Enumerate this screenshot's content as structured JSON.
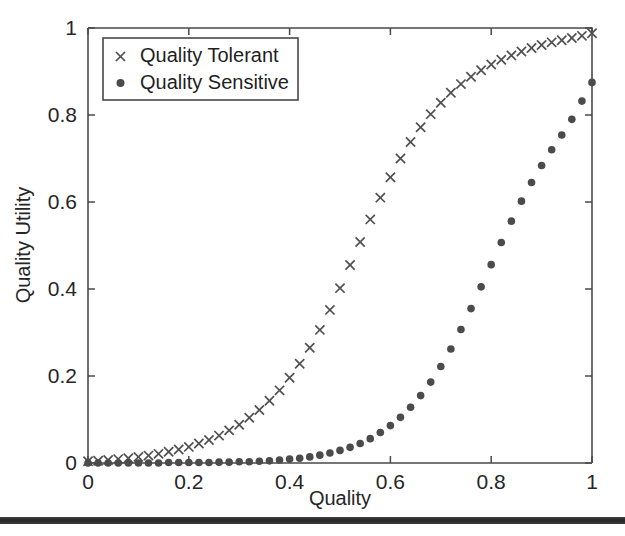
{
  "figure": {
    "background_color": "#ffffff",
    "axis_color": "#4a4a4a",
    "marker_color": "#4b4b4b"
  },
  "axis_titles": {
    "x": "Quality",
    "y": "Quality Utility"
  },
  "x_tick_labels": [
    "0",
    "0.2",
    "0.4",
    "0.6",
    "0.8",
    "1"
  ],
  "y_tick_labels": [
    "0",
    "0.2",
    "0.4",
    "0.6",
    "0.8",
    "1"
  ],
  "legend": {
    "position": "upper-left",
    "entries": [
      {
        "label": "Quality Tolerant",
        "marker": "x-marker"
      },
      {
        "label": "Quality Sensitive",
        "marker": "dot-marker"
      }
    ]
  },
  "artifacts": {
    "scan_bar_label": "scan-artifact-bar"
  },
  "chart_data": {
    "type": "scatter",
    "title": "",
    "xlabel": "Quality",
    "ylabel": "Quality Utility",
    "xlim": [
      0,
      1
    ],
    "ylim": [
      0,
      1
    ],
    "xticks": [
      0,
      0.2,
      0.4,
      0.6,
      0.8,
      1
    ],
    "yticks": [
      0,
      0.2,
      0.4,
      0.6,
      0.8,
      1
    ],
    "grid": false,
    "legend_position": "upper left",
    "x": [
      0,
      0.02,
      0.04,
      0.06,
      0.08,
      0.1,
      0.12,
      0.14,
      0.16,
      0.18,
      0.2,
      0.22,
      0.24,
      0.26,
      0.28,
      0.3,
      0.32,
      0.34,
      0.36,
      0.38,
      0.4,
      0.42,
      0.44,
      0.46,
      0.48,
      0.5,
      0.52,
      0.54,
      0.56,
      0.58,
      0.6,
      0.62,
      0.64,
      0.66,
      0.68,
      0.7,
      0.72,
      0.74,
      0.76,
      0.78,
      0.8,
      0.82,
      0.84,
      0.86,
      0.88,
      0.9,
      0.92,
      0.94,
      0.96,
      0.98,
      1
    ],
    "series": [
      {
        "name": "Quality Tolerant",
        "marker": "x",
        "color": "#505050",
        "values": [
          0.004,
          0.005,
          0.007,
          0.009,
          0.011,
          0.014,
          0.017,
          0.021,
          0.026,
          0.031,
          0.037,
          0.045,
          0.053,
          0.063,
          0.075,
          0.088,
          0.104,
          0.122,
          0.143,
          0.167,
          0.196,
          0.228,
          0.265,
          0.306,
          0.352,
          0.402,
          0.455,
          0.508,
          0.56,
          0.61,
          0.657,
          0.7,
          0.738,
          0.772,
          0.802,
          0.828,
          0.851,
          0.871,
          0.888,
          0.903,
          0.916,
          0.927,
          0.937,
          0.946,
          0.954,
          0.961,
          0.967,
          0.972,
          0.977,
          0.982,
          0.988
        ]
      },
      {
        "name": "Quality Sensitive",
        "marker": "o",
        "color": "#4b4b4b",
        "values": [
          0.0,
          0.0,
          0.0,
          0.0,
          0.0,
          0.0,
          0.0,
          0.0,
          0.001,
          0.001,
          0.001,
          0.001,
          0.001,
          0.002,
          0.002,
          0.003,
          0.003,
          0.004,
          0.005,
          0.007,
          0.009,
          0.011,
          0.014,
          0.018,
          0.023,
          0.029,
          0.036,
          0.045,
          0.056,
          0.07,
          0.086,
          0.105,
          0.128,
          0.155,
          0.186,
          0.222,
          0.262,
          0.307,
          0.355,
          0.405,
          0.456,
          0.507,
          0.556,
          0.602,
          0.645,
          0.684,
          0.72,
          0.754,
          0.79,
          0.832,
          0.875
        ]
      }
    ]
  }
}
